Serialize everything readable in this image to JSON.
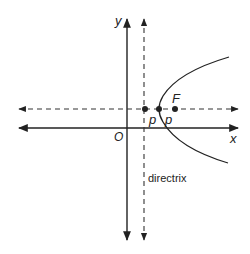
{
  "diagram": {
    "title": "",
    "type": "parabola-focus-directrix",
    "labels": {
      "y_axis": "y",
      "x_axis": "x",
      "origin": "O",
      "focus": "F",
      "p_left": "p",
      "p_right": "p",
      "directrix": "directrix"
    },
    "colors": {
      "stroke": "#222222",
      "background": "#ffffff"
    },
    "geometry": {
      "y_axis_x": 127,
      "x_axis_y": 128,
      "directrix_x": 144,
      "axis_of_symmetry_y": 109,
      "points": [
        {
          "name": "directrix-point",
          "x": 145,
          "y": 109
        },
        {
          "name": "vertex",
          "x": 159,
          "y": 109
        },
        {
          "name": "focus",
          "x": 175,
          "y": 109
        }
      ]
    }
  }
}
